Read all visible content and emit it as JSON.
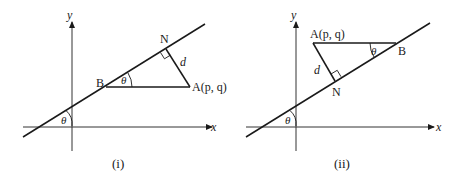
{
  "panels": [
    {
      "caption": "(i)",
      "axis_x_label": "x",
      "axis_y_label": "y",
      "point_A": "A(p, q)",
      "point_B": "B",
      "point_N": "N",
      "distance_label": "d",
      "angle_at_B": "θ",
      "angle_at_axis": "θ"
    },
    {
      "caption": "(ii)",
      "axis_x_label": "x",
      "axis_y_label": "y",
      "point_A": "A(p, q)",
      "point_B": "B",
      "point_N": "N",
      "distance_label": "d",
      "angle_at_B": "θ",
      "angle_at_axis": "θ"
    }
  ],
  "colors": {
    "stroke": "#1a1a1a",
    "axis": "#333333"
  }
}
